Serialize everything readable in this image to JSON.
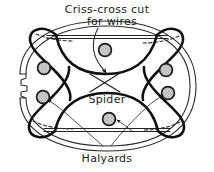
{
  "figure": {
    "background_color": "#ffffff",
    "ink_color": "#1a1a1a",
    "labels": {
      "top_line_1": "Criss-cross cut",
      "top_line_2": "for wires",
      "center": "Spider",
      "bottom": "Halyards"
    },
    "parts": {
      "outer_rim_name": "outer rim",
      "spider_name": "spider",
      "grommet_name": "grommet",
      "halyard_name": "halyard",
      "criss_cross_name": "criss-cross cut",
      "hook_notch_name": "hook notch"
    },
    "grommets": [
      {
        "id": "top-center",
        "cx": 105,
        "cy": 50,
        "r": 6.4
      },
      {
        "id": "left-upper",
        "cx": 44,
        "cy": 68,
        "r": 6.4
      },
      {
        "id": "left-lower",
        "cx": 43,
        "cy": 97,
        "r": 6.4
      },
      {
        "id": "right-upper",
        "cx": 166,
        "cy": 70,
        "r": 6.4
      },
      {
        "id": "right-lower",
        "cx": 168,
        "cy": 93,
        "r": 6.4
      },
      {
        "id": "bottom-center",
        "cx": 109,
        "cy": 119,
        "r": 6.4
      }
    ],
    "icons": {
      "arrow_to_criss_cross": "arrow-down-icon",
      "arrow_to_left_grommet": "arrow-up-left-icon",
      "arrow_to_right_grommet": "arrow-up-right-icon",
      "arrow_to_bottom_grommet": "arrow-left-icon"
    }
  }
}
